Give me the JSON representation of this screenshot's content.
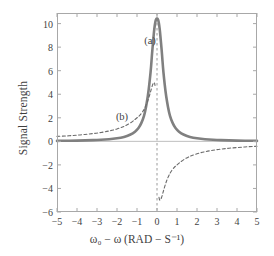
{
  "chart_data": {
    "type": "line",
    "title": "",
    "xlabel": "ω₀ − ω (RAD − S⁻¹)",
    "ylabel": "Signal Strength",
    "xlim": [
      -5,
      5
    ],
    "ylim": [
      -6,
      10.9
    ],
    "grid": false,
    "legend": "inline-annotations",
    "xticks": [
      "-5",
      "-4",
      "-3",
      "-2",
      "-1",
      "0",
      "1",
      "2",
      "3",
      "4",
      "5"
    ],
    "xtick_values": [
      -5,
      -4,
      -3,
      -2,
      -1,
      0,
      1,
      2,
      3,
      4,
      5
    ],
    "yticks": [
      "10",
      "8",
      "6",
      "4",
      "2",
      "0",
      "-2",
      "-4",
      "-6"
    ],
    "ytick_values": [
      10,
      8,
      6,
      4,
      2,
      0,
      -2,
      -4,
      -6
    ],
    "annotations": [
      {
        "text": "(a)",
        "x": -0.35,
        "y": 8.6
      },
      {
        "text": "(b)",
        "x": -1.75,
        "y": 2.15
      }
    ],
    "series": [
      {
        "name": "(a)",
        "label": "absorption (Lorentzian)",
        "style": "solid",
        "color": "#808080",
        "width": 2.6,
        "x": [
          -5.0,
          -4.6,
          -4.2,
          -3.8,
          -3.4,
          -3.0,
          -2.6,
          -2.2,
          -1.8,
          -1.5,
          -1.2,
          -1.0,
          -0.85,
          -0.7,
          -0.6,
          -0.5,
          -0.42,
          -0.35,
          -0.3,
          -0.25,
          -0.21,
          -0.18,
          -0.15,
          -0.12,
          -0.1,
          -0.08,
          -0.06,
          -0.04,
          -0.02,
          0.0,
          0.02,
          0.04,
          0.06,
          0.08,
          0.1,
          0.12,
          0.15,
          0.18,
          0.21,
          0.25,
          0.3,
          0.35,
          0.42,
          0.5,
          0.6,
          0.7,
          0.85,
          1.0,
          1.2,
          1.5,
          1.8,
          2.2,
          2.6,
          3.0,
          3.4,
          3.8,
          4.2,
          4.6,
          5.0
        ],
        "y": [
          0.04,
          0.05,
          0.06,
          0.07,
          0.09,
          0.11,
          0.15,
          0.21,
          0.31,
          0.44,
          0.68,
          0.96,
          1.3,
          1.88,
          2.46,
          3.38,
          4.28,
          5.38,
          6.25,
          7.4,
          8.2,
          8.75,
          9.3,
          9.75,
          9.98,
          10.17,
          10.3,
          10.38,
          10.42,
          10.43,
          10.42,
          10.38,
          10.3,
          10.17,
          9.98,
          9.75,
          9.3,
          8.75,
          8.2,
          7.4,
          6.25,
          5.38,
          4.28,
          3.38,
          2.46,
          1.88,
          1.3,
          0.96,
          0.68,
          0.44,
          0.31,
          0.21,
          0.15,
          0.11,
          0.09,
          0.07,
          0.06,
          0.05,
          0.04
        ]
      },
      {
        "name": "(b)",
        "label": "dispersion",
        "style": "dashed",
        "color": "#6b6b6b",
        "width": 1.1,
        "x": [
          -5.0,
          -4.6,
          -4.2,
          -3.8,
          -3.4,
          -3.0,
          -2.6,
          -2.2,
          -1.8,
          -1.5,
          -1.2,
          -1.0,
          -0.85,
          -0.7,
          -0.6,
          -0.5,
          -0.42,
          -0.35,
          -0.3,
          -0.25,
          -0.21,
          -0.18,
          -0.15,
          -0.13,
          -0.115,
          -0.105,
          -0.1,
          0.1,
          0.105,
          0.115,
          0.13,
          0.15,
          0.18,
          0.21,
          0.25,
          0.3,
          0.35,
          0.42,
          0.5,
          0.6,
          0.7,
          0.85,
          1.0,
          1.2,
          1.5,
          1.8,
          2.2,
          2.6,
          3.0,
          3.4,
          3.8,
          4.2,
          4.6,
          5.0
        ],
        "y": [
          0.42,
          0.45,
          0.5,
          0.55,
          0.62,
          0.7,
          0.81,
          0.95,
          1.16,
          1.38,
          1.71,
          2.0,
          2.22,
          2.56,
          2.86,
          3.26,
          3.64,
          4.04,
          4.35,
          4.65,
          4.85,
          4.95,
          5.0,
          4.98,
          4.9,
          4.8,
          4.75,
          -4.75,
          -4.8,
          -4.9,
          -4.98,
          -5.0,
          -4.95,
          -4.85,
          -4.65,
          -4.35,
          -4.04,
          -3.64,
          -3.26,
          -2.86,
          -2.56,
          -2.22,
          -2.0,
          -1.71,
          -1.38,
          -1.16,
          -0.95,
          -0.81,
          -0.7,
          -0.62,
          -0.55,
          -0.5,
          -0.45,
          -0.42
        ]
      }
    ],
    "zero_line": {
      "y": 0,
      "color": "#bfbfbf"
    },
    "center_line": {
      "x": 0,
      "style": "dashed",
      "color": "#9a9a9a"
    }
  },
  "axes": {
    "frame_color": "#a8a8a8",
    "tick_color": "#a8a8a8"
  }
}
